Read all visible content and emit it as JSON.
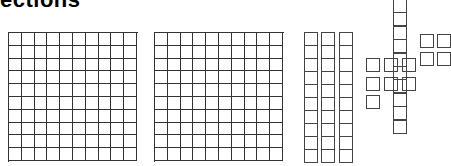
{
  "title": "ections",
  "figure": {
    "hundred_flats": [
      {
        "name": "flat-1",
        "x": 8,
        "y": 32,
        "cols": 10,
        "rows": 10,
        "cell": 12.8
      },
      {
        "name": "flat-2",
        "x": 154,
        "y": 32,
        "cols": 10,
        "rows": 10,
        "cell": 12.8
      }
    ],
    "ten_rods": [
      {
        "name": "rod-1",
        "x": 304,
        "y": 32,
        "cells": 10
      },
      {
        "name": "rod-2",
        "x": 321,
        "y": 32,
        "cells": 10
      },
      {
        "name": "rod-3",
        "x": 339,
        "y": 32,
        "cells": 10
      }
    ],
    "vertical_rod": {
      "x": 393,
      "y": -1,
      "cells": 10,
      "cell": 13.4
    },
    "unit_cubes": [
      {
        "x": 366,
        "y": 58
      },
      {
        "x": 366,
        "y": 77
      },
      {
        "x": 366,
        "y": 95
      },
      {
        "x": 384,
        "y": 58
      },
      {
        "x": 384,
        "y": 77
      },
      {
        "x": 402,
        "y": 58
      },
      {
        "x": 402,
        "y": 77
      },
      {
        "x": 420,
        "y": 34
      },
      {
        "x": 437,
        "y": 34
      },
      {
        "x": 420,
        "y": 52
      },
      {
        "x": 437,
        "y": 52
      }
    ],
    "colors": {
      "line": "#333333",
      "background": "#ffffff"
    }
  }
}
